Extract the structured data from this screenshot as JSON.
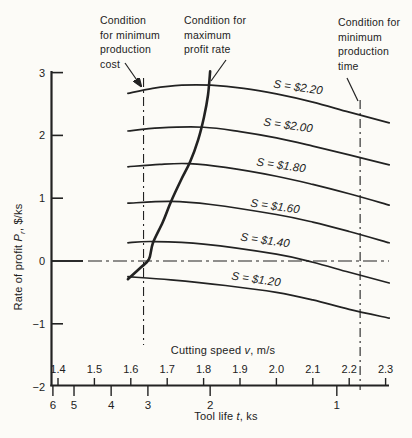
{
  "figure": {
    "background": "#fcfbf7",
    "ink": "#222222"
  },
  "annotations": [
    {
      "id": "min-production-cost",
      "lines": [
        "Condition",
        "for minimum",
        "production",
        "cost"
      ]
    },
    {
      "id": "max-profit-rate",
      "lines": [
        "Condition for",
        "maximum",
        "profit rate"
      ]
    },
    {
      "id": "min-production-time",
      "lines": [
        "Condition for",
        "minimum",
        "production",
        "time"
      ]
    }
  ],
  "axes": {
    "y_title": {
      "pre": "Rate of profit ",
      "var": "P",
      "sub": "r",
      "post": ", $/ks"
    },
    "x_title": {
      "pre": "Cutting speed ",
      "var": "v",
      "post": ", m/s"
    },
    "x2_title": {
      "pre": "Tool life ",
      "var": "t",
      "post": ", ks"
    }
  },
  "chart_data": {
    "type": "line",
    "title": "",
    "xlabel": "Cutting speed v, m/s",
    "x2label": "Tool life t, ks",
    "ylabel": "Rate of profit Pr, $/ks",
    "xlim": [
      1.38,
      2.31
    ],
    "ylim": [
      -2,
      3
    ],
    "grid": false,
    "legend_position": "labels-on-curves",
    "x_axis": {
      "ticks": [
        {
          "label": "1.4",
          "value": 1.4
        },
        {
          "label": "1.5",
          "value": 1.5
        },
        {
          "label": "1.6",
          "value": 1.6
        },
        {
          "label": "1.7",
          "value": 1.7
        },
        {
          "label": "1.8",
          "value": 1.8
        },
        {
          "label": "1.9",
          "value": 1.9
        },
        {
          "label": "2.0",
          "value": 2.0
        },
        {
          "label": "2.1",
          "value": 2.1
        },
        {
          "label": "2.2",
          "value": 2.2
        },
        {
          "label": "2.3",
          "value": 2.3
        }
      ]
    },
    "x2_axis": {
      "note": "tool life scale, nonlinear, v is equivalent cutting speed position",
      "ticks": [
        {
          "label": "6",
          "v": 1.386
        },
        {
          "label": "5",
          "v": 1.444
        },
        {
          "label": "4",
          "v": 1.546
        },
        {
          "label": "3",
          "v": 1.647
        },
        {
          "label": "2",
          "v": 1.818
        },
        {
          "label": "1",
          "v": 2.166
        }
      ]
    },
    "y_axis": {
      "ticks": [
        {
          "label": "3",
          "value": 3
        },
        {
          "label": "2",
          "value": 2
        },
        {
          "label": "1",
          "value": 1
        },
        {
          "label": "0",
          "value": 0
        },
        {
          "label": "−1",
          "value": -1
        },
        {
          "label": "−2",
          "value": -2
        }
      ]
    },
    "series": [
      {
        "name": "S = $2.20",
        "points": [
          [
            1.592,
            2.67
          ],
          [
            1.66,
            2.75
          ],
          [
            1.74,
            2.8
          ],
          [
            1.82,
            2.8
          ],
          [
            1.91,
            2.75
          ],
          [
            2.0,
            2.66
          ],
          [
            2.1,
            2.53
          ],
          [
            2.2,
            2.37
          ],
          [
            2.31,
            2.2
          ]
        ]
      },
      {
        "name": "S = $2.00",
        "points": [
          [
            1.592,
            2.07
          ],
          [
            1.68,
            2.12
          ],
          [
            1.8,
            2.13
          ],
          [
            1.9,
            2.06
          ],
          [
            2.0,
            1.96
          ],
          [
            2.1,
            1.83
          ],
          [
            2.2,
            1.69
          ],
          [
            2.31,
            1.53
          ]
        ]
      },
      {
        "name": "S = $1.80",
        "points": [
          [
            1.592,
            1.5
          ],
          [
            1.68,
            1.54
          ],
          [
            1.76,
            1.55
          ],
          [
            1.86,
            1.49
          ],
          [
            2.0,
            1.35
          ],
          [
            2.1,
            1.22
          ],
          [
            2.2,
            1.07
          ],
          [
            2.31,
            0.89
          ]
        ]
      },
      {
        "name": "S = $1.60",
        "points": [
          [
            1.592,
            0.92
          ],
          [
            1.71,
            0.95
          ],
          [
            1.82,
            0.9
          ],
          [
            2.0,
            0.74
          ],
          [
            2.1,
            0.62
          ],
          [
            2.2,
            0.47
          ],
          [
            2.31,
            0.29
          ]
        ]
      },
      {
        "name": "S = $1.40",
        "points": [
          [
            1.592,
            0.29
          ],
          [
            1.66,
            0.31
          ],
          [
            1.8,
            0.27
          ],
          [
            2.0,
            0.11
          ],
          [
            2.1,
            -0.02
          ],
          [
            2.2,
            -0.18
          ],
          [
            2.31,
            -0.35
          ]
        ]
      },
      {
        "name": "S = $1.20",
        "points": [
          [
            1.592,
            -0.25
          ],
          [
            1.71,
            -0.3
          ],
          [
            1.86,
            -0.39
          ],
          [
            2.0,
            -0.5
          ],
          [
            2.1,
            -0.62
          ],
          [
            2.2,
            -0.77
          ],
          [
            2.31,
            -0.91
          ]
        ]
      }
    ],
    "locus": {
      "name": "maximum profit rate locus",
      "points": [
        [
          1.592,
          -0.29
        ],
        [
          1.628,
          -0.1
        ],
        [
          1.65,
          0.03
        ],
        [
          1.661,
          0.29
        ],
        [
          1.688,
          0.62
        ],
        [
          1.71,
          0.94
        ],
        [
          1.738,
          1.29
        ],
        [
          1.763,
          1.58
        ],
        [
          1.785,
          1.93
        ],
        [
          1.801,
          2.29
        ],
        [
          1.812,
          2.64
        ],
        [
          1.818,
          3.02
        ]
      ]
    },
    "reference_lines": {
      "zero_profit_P": 0,
      "min_cost_v": 1.635,
      "min_time_v": 2.23
    }
  }
}
